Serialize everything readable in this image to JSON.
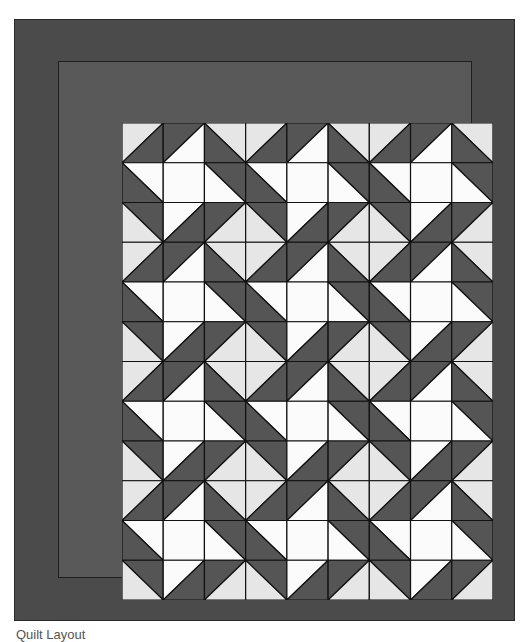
{
  "caption": "Quilt Layout",
  "colors": {
    "outer_border": "#4b4b4b",
    "inner_border": "#595959",
    "dark": "#555555",
    "light": "#e6e6e6",
    "white": "#fbfbfb",
    "outline": "#111111"
  },
  "quilt": {
    "columns": 9,
    "rows": 12,
    "cell_width": 41.22,
    "cell_height": 39.75,
    "repeat_tile": [
      [
        {
          "diag": "/",
          "a": "light",
          "b": "dark"
        },
        {
          "diag": "/",
          "a": "dark",
          "b": "white"
        },
        {
          "diag": "\\",
          "a": "light",
          "b": "dark"
        }
      ],
      [
        {
          "diag": "\\",
          "a": "white",
          "b": "dark"
        },
        {
          "diag": "none",
          "a": "white",
          "b": "white"
        },
        {
          "diag": "\\",
          "a": "dark",
          "b": "white"
        }
      ],
      [
        {
          "diag": "\\",
          "a": "dark",
          "b": "light"
        },
        {
          "diag": "/",
          "a": "white",
          "b": "dark"
        },
        {
          "diag": "/",
          "a": "dark",
          "b": "light"
        }
      ]
    ],
    "legend": {
      "diag_slash": "a = top-left triangle, b = bottom-right triangle",
      "diag_backslash": "a = top-right triangle, b = bottom-left triangle"
    }
  }
}
